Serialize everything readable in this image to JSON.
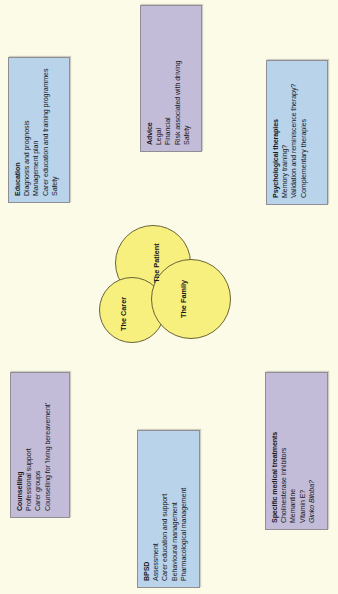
{
  "diagram": {
    "background_color": "#fcfbe8",
    "blue_box_color": "#b8d3ea",
    "purple_box_color": "#c3bcd8",
    "circle_color": "#f7f07e"
  },
  "center": {
    "circles": [
      {
        "label": "The Patient"
      },
      {
        "label": "The Family"
      },
      {
        "label": "The Carer"
      }
    ]
  },
  "boxes": [
    {
      "id": "education",
      "color": "blue",
      "title": "Education",
      "items": [
        {
          "text": "Diagnosis and prognosis",
          "italic": false
        },
        {
          "text": "Management plan",
          "italic": false
        },
        {
          "text": "Carer education and training programmes",
          "italic": false
        },
        {
          "text": "Safety",
          "italic": false
        }
      ]
    },
    {
      "id": "advice",
      "color": "purple",
      "title": "Advice",
      "items": [
        {
          "text": "Legal",
          "italic": false
        },
        {
          "text": "Financial",
          "italic": false
        },
        {
          "text": "Risk associated with driving",
          "italic": false
        },
        {
          "text": "Safety",
          "italic": false
        }
      ]
    },
    {
      "id": "psychological-therapies",
      "color": "blue",
      "title": "Psychological therapies",
      "items": [
        {
          "text": "Memory training?",
          "italic": false
        },
        {
          "text": "Validation and reminiscence therapy?",
          "italic": false
        },
        {
          "text": "Complementary therapies",
          "italic": false
        }
      ]
    },
    {
      "id": "counselling",
      "color": "purple",
      "title": "Counselling",
      "items": [
        {
          "text": "Professional support",
          "italic": false
        },
        {
          "text": "Carer groups",
          "italic": false
        },
        {
          "text": "Counselling for 'living bereavement'",
          "italic": false
        }
      ]
    },
    {
      "id": "bpsd",
      "color": "blue",
      "title": "BPSD",
      "items": [
        {
          "text": "Assessment",
          "italic": false
        },
        {
          "text": "Carer education and support",
          "italic": false
        },
        {
          "text": "Behavioural management",
          "italic": false
        },
        {
          "text": "Pharmacological management",
          "italic": false
        }
      ]
    },
    {
      "id": "specific-medical-treatments",
      "color": "purple",
      "title": "Specific medical treatments",
      "items": [
        {
          "text": "Cholinesterase inhibitors",
          "italic": false
        },
        {
          "text": "Memantine",
          "italic": false
        },
        {
          "text": "Vitamin E?",
          "italic": false
        },
        {
          "text": "Ginko Biloba?",
          "italic": true
        }
      ]
    }
  ]
}
